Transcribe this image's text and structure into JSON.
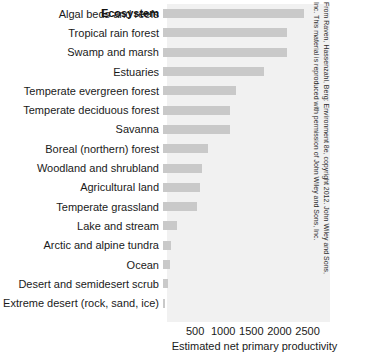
{
  "chart_data": {
    "type": "bar",
    "orientation": "horizontal",
    "title": "",
    "column_header": "Ecosystem",
    "xlabel": "Estimated net primary  productivity",
    "ylabel": "",
    "xlim": [
      0,
      2900
    ],
    "xticks": [
      500,
      1000,
      1500,
      2000,
      2500
    ],
    "xtick_labels": [
      "500",
      "1000",
      "1500",
      "2000",
      "2500"
    ],
    "grid": false,
    "legend": null,
    "bar_color": "#c9c9c9",
    "plot_background": "#f1f1f1",
    "categories": [
      "Algal beds and reefs",
      "Tropical rain forest",
      "Swamp and marsh",
      "Estuaries",
      "Temperate evergreen forest",
      "Temperate deciduous forest",
      "Savanna",
      "Boreal (northern) forest",
      "Woodland and shrubland",
      "Agricultural land",
      "Temperate grassland",
      "Lake and stream",
      "Arctic and alpine tundra",
      "Ocean",
      "Desert and semidesert scrub",
      "Extreme desert (rock, sand, ice)"
    ],
    "values": [
      2500,
      2200,
      2200,
      1800,
      1300,
      1200,
      1200,
      800,
      700,
      650,
      600,
      250,
      140,
      125,
      90,
      30
    ]
  },
  "credit": {
    "line1": "From Raven, Hassenzahl, Berg: Environment 8e, copyright 2012. John Wiley and Sons,",
    "line2": "Inc. This material is reproduced with permission of John Wiley and Sons, Inc."
  }
}
